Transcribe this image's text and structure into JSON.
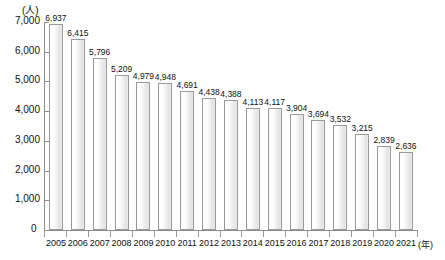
{
  "chart_data": {
    "type": "bar",
    "title": "",
    "subtitle": "",
    "xlabel": "(年)",
    "ylabel": "(人)",
    "unit_label": "(人)",
    "x_axis_suffix": "(年)",
    "categories": [
      "2005",
      "2006",
      "2007",
      "2008",
      "2009",
      "2010",
      "2011",
      "2012",
      "2013",
      "2014",
      "2015",
      "2016",
      "2017",
      "2018",
      "2019",
      "2020",
      "2021"
    ],
    "values": [
      6937,
      6415,
      5796,
      5209,
      4979,
      4948,
      4691,
      4438,
      4388,
      4113,
      4117,
      3904,
      3694,
      3532,
      3215,
      2839,
      2636
    ],
    "value_labels": [
      "6,937",
      "6,415",
      "5,796",
      "5,209",
      "4,979",
      "4,948",
      "4,691",
      "4,438",
      "4,388",
      "4,113",
      "4,117",
      "3,904",
      "3,694",
      "3,532",
      "3,215",
      "2,839",
      "2,636"
    ],
    "ylim": [
      0,
      7000
    ],
    "ytick_values": [
      0,
      1000,
      2000,
      3000,
      4000,
      5000,
      6000,
      7000
    ],
    "ytick_labels": [
      "0",
      "1,000",
      "2,000",
      "3,000",
      "4,000",
      "5,000",
      "6,000",
      "7,000"
    ],
    "grid": false,
    "legend": null,
    "bar_fill_color": "#f2f2f2",
    "bar_border_color": "#9a9a9a",
    "axis_color": "#8c8c8c",
    "text_color": "#111111"
  }
}
